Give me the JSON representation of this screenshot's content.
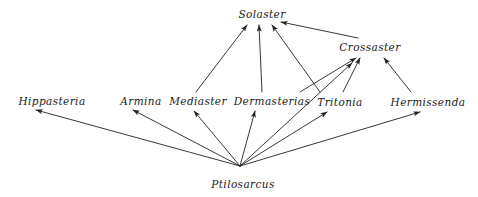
{
  "diagram": {
    "type": "food-web",
    "background_color": "#ffffff",
    "line_color": "#222222",
    "text_color": "#1a1a1a",
    "width": 478,
    "height": 197,
    "nodes": [
      {
        "id": "solaster",
        "label": "Solaster",
        "x": 262,
        "y": 14
      },
      {
        "id": "crossaster",
        "label": "Crossaster",
        "x": 370,
        "y": 47
      },
      {
        "id": "hippasteria",
        "label": "Hippasteria",
        "x": 52,
        "y": 101
      },
      {
        "id": "armina",
        "label": "Armina",
        "x": 141,
        "y": 101
      },
      {
        "id": "mediaster",
        "label": "Mediaster",
        "x": 198,
        "y": 101
      },
      {
        "id": "dermasterias",
        "label": "Dermasterias",
        "x": 272,
        "y": 101
      },
      {
        "id": "tritonia",
        "label": "Tritonia",
        "x": 340,
        "y": 102
      },
      {
        "id": "hermissenda",
        "label": "Hermissenda",
        "x": 428,
        "y": 102
      },
      {
        "id": "ptilosarcus",
        "label": "Ptilosarcus",
        "x": 243,
        "y": 184
      }
    ],
    "edges": [
      {
        "id": "ptilosarcus-hippasteria",
        "from": "ptilosarcus",
        "to": "hippasteria",
        "x1": 240,
        "y1": 166,
        "x2": 36,
        "y2": 110
      },
      {
        "id": "ptilosarcus-armina",
        "from": "ptilosarcus",
        "to": "armina",
        "x1": 240,
        "y1": 166,
        "x2": 133,
        "y2": 110
      },
      {
        "id": "ptilosarcus-mediaster",
        "from": "ptilosarcus",
        "to": "mediaster",
        "x1": 240,
        "y1": 166,
        "x2": 194,
        "y2": 111
      },
      {
        "id": "ptilosarcus-dermasterias",
        "from": "ptilosarcus",
        "to": "dermasterias",
        "x1": 240,
        "y1": 166,
        "x2": 255,
        "y2": 111
      },
      {
        "id": "ptilosarcus-tritonia",
        "from": "ptilosarcus",
        "to": "tritonia",
        "x1": 240,
        "y1": 166,
        "x2": 327,
        "y2": 112
      },
      {
        "id": "ptilosarcus-tritonia-b",
        "from": "ptilosarcus",
        "to": "tritonia",
        "x1": 240,
        "y1": 166,
        "x2": 352,
        "y2": 63
      },
      {
        "id": "ptilosarcus-hermissenda",
        "from": "ptilosarcus",
        "to": "hermissenda",
        "x1": 240,
        "y1": 166,
        "x2": 420,
        "y2": 112
      },
      {
        "id": "mediaster-solaster",
        "from": "mediaster",
        "to": "solaster",
        "x1": 196,
        "y1": 92,
        "x2": 247,
        "y2": 25
      },
      {
        "id": "dermasterias-solaster",
        "from": "dermasterias",
        "to": "solaster",
        "x1": 262,
        "y1": 92,
        "x2": 259,
        "y2": 25
      },
      {
        "id": "tritonia-solaster",
        "from": "tritonia",
        "to": "solaster",
        "x1": 320,
        "y1": 92,
        "x2": 272,
        "y2": 25
      },
      {
        "id": "crossaster-solaster",
        "from": "crossaster",
        "to": "solaster",
        "x1": 358,
        "y1": 38,
        "x2": 281,
        "y2": 22
      },
      {
        "id": "dermasterias-crossaster",
        "from": "dermasterias",
        "to": "crossaster",
        "x1": 300,
        "y1": 92,
        "x2": 356,
        "y2": 58
      },
      {
        "id": "tritonia-crossaster",
        "from": "tritonia",
        "to": "crossaster",
        "x1": 343,
        "y1": 92,
        "x2": 360,
        "y2": 58
      },
      {
        "id": "hermissenda-crossaster",
        "from": "hermissenda",
        "to": "crossaster",
        "x1": 411,
        "y1": 92,
        "x2": 384,
        "y2": 58
      }
    ]
  }
}
